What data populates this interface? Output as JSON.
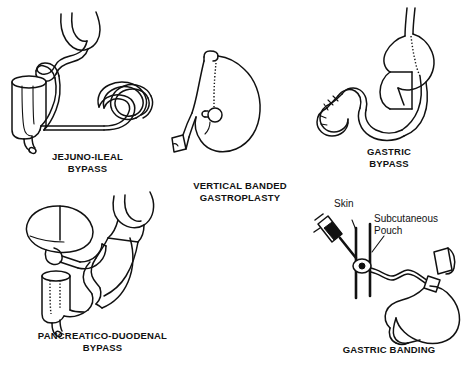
{
  "figure": {
    "background_color": "#ffffff",
    "line_color": "#111111"
  },
  "panels": [
    {
      "id": "jejuno-ileal-bypass",
      "caption": "JEJUNO-ILEAL\nBYPASS",
      "annotations": []
    },
    {
      "id": "vertical-banded-gastroplasty",
      "caption": "VERTICAL BANDED\nGASTROPLASTY",
      "annotations": []
    },
    {
      "id": "gastric-bypass",
      "caption": "GASTRIC\nBYPASS",
      "annotations": []
    },
    {
      "id": "pancreatico-duodenal-bypass",
      "caption": "PANCREATICO-DUODENAL\nBYPASS",
      "annotations": []
    },
    {
      "id": "gastric-banding",
      "caption": "GASTRIC BANDING",
      "annotations": [
        {
          "id": "skin",
          "label": "Skin"
        },
        {
          "id": "subcutaneous-pouch",
          "label": "Subcutaneous\nPouch"
        }
      ]
    }
  ]
}
